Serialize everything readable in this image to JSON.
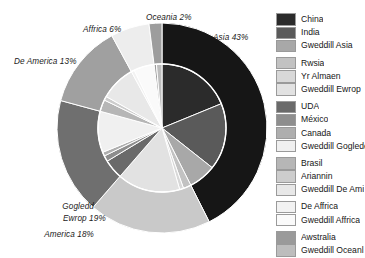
{
  "chart_data": {
    "type": "pie",
    "title": "",
    "subtitle": "",
    "variant": "nested-double-ring",
    "legend_position": "right",
    "grid": false,
    "rings": [
      {
        "name": "outer",
        "role": "continents",
        "categories": [
          "Asia",
          "Ewrop",
          "Gogledd America",
          "De America",
          "Affrica",
          "Oceania"
        ],
        "values": [
          43,
          19,
          18,
          13,
          6,
          2
        ],
        "unit": "%",
        "colors": [
          "#161616",
          "#c9c9c9",
          "#6f6f6f",
          "#a0a0a0",
          "#ededed",
          "#9d9d9d"
        ],
        "labels": [
          {
            "text": "Asia 43%",
            "category": "Asia",
            "value": 43
          },
          {
            "text": "Ewrop 19%",
            "category": "Ewrop",
            "value": 19
          },
          {
            "text": "Gogledd\nAmerica 18%",
            "category": "Gogledd America",
            "value": 18
          },
          {
            "text": "De America 13%",
            "category": "De America",
            "value": 13
          },
          {
            "text": "Affrica 6%",
            "category": "Affrica",
            "value": 6
          },
          {
            "text": "Oceania 2%",
            "category": "Oceania",
            "value": 2
          }
        ]
      },
      {
        "name": "inner",
        "role": "countries",
        "categories": [
          "China",
          "India",
          "Gweddill Asia",
          "Rwsia",
          "Yr Almaen",
          "Gweddill Ewrop",
          "UDA",
          "México",
          "Canada",
          "Gweddill Gogledd",
          "Brasil",
          "Ariannin",
          "Gweddill De America",
          "De Affrica",
          "Gweddill Affrica",
          "Awstralia",
          "Gweddill Oceania"
        ],
        "values": [
          19,
          17,
          7,
          2,
          1,
          16,
          5,
          1.5,
          1,
          10.5,
          3,
          1,
          9,
          0.8,
          5.2,
          0.6,
          1.4
        ],
        "unit": "%",
        "colors": [
          "#2b2b2b",
          "#5a5a5a",
          "#a8a8a8",
          "#c2c2c2",
          "#d8d8d8",
          "#e2e2e2",
          "#6a6a6a",
          "#8e8e8e",
          "#aeaeae",
          "#f0f0f0",
          "#b6b6b6",
          "#cdcdcd",
          "#e8e8e8",
          "#f2f2f2",
          "#fafafa",
          "#9a9a9a",
          "#bdbdbd"
        ]
      }
    ]
  },
  "labels": {
    "asia": "Asia 43%",
    "oceania": "Oceania 2%",
    "affrica": "Affrica 6%",
    "de_america": "De America 13%",
    "gogledd_line1": "Gogledd",
    "gogledd_line2": "America 18%",
    "ewrop": "Ewrop 19%"
  },
  "legend": {
    "groups": [
      {
        "name": "asia",
        "items": [
          {
            "label": "China",
            "color": "#2b2b2b"
          },
          {
            "label": "India",
            "color": "#5a5a5a"
          },
          {
            "label": "Gweddill Asia",
            "color": "#a8a8a8"
          }
        ]
      },
      {
        "name": "ewrop",
        "items": [
          {
            "label": "Rwsia",
            "color": "#c2c2c2"
          },
          {
            "label": "Yr Almaen",
            "color": "#d8d8d8"
          },
          {
            "label": "Gweddill Ewrop",
            "color": "#e2e2e2"
          }
        ]
      },
      {
        "name": "gogledd-america",
        "items": [
          {
            "label": "UDA",
            "color": "#6a6a6a"
          },
          {
            "label": "México",
            "color": "#8e8e8e"
          },
          {
            "label": "Canada",
            "color": "#aeaeae"
          },
          {
            "label": "Gweddill Goglede",
            "color": "#f0f0f0"
          }
        ]
      },
      {
        "name": "de-america",
        "items": [
          {
            "label": "Brasil",
            "color": "#b6b6b6"
          },
          {
            "label": "Ariannin",
            "color": "#cdcdcd"
          },
          {
            "label": "Gweddill De Ami",
            "color": "#e8e8e8"
          }
        ]
      },
      {
        "name": "affrica",
        "items": [
          {
            "label": "De Affrica",
            "color": "#f2f2f2"
          },
          {
            "label": "Gweddill Affrica",
            "color": "#fafafa"
          }
        ]
      },
      {
        "name": "oceania",
        "items": [
          {
            "label": "Awstralia",
            "color": "#9a9a9a"
          },
          {
            "label": "Gweddill Oceanl",
            "color": "#bdbdbd"
          }
        ]
      }
    ]
  }
}
